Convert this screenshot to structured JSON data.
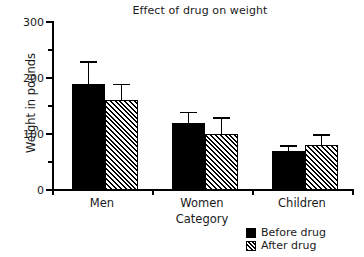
{
  "chart_data": {
    "type": "bar",
    "title": "Effect of drug on weight",
    "xlabel": "Category",
    "ylabel": "Weight in pounds",
    "categories": [
      "Men",
      "Women",
      "Children"
    ],
    "series": [
      {
        "name": "Before drug",
        "fill": "solid-black",
        "values": [
          190,
          120,
          70
        ],
        "errors": [
          40,
          20,
          10
        ]
      },
      {
        "name": "After drug",
        "fill": "diagonal-hatch",
        "values": [
          160,
          100,
          80
        ],
        "errors": [
          30,
          30,
          20
        ]
      }
    ],
    "ylim": [
      0,
      300
    ],
    "yticks": [
      0,
      100,
      200,
      300
    ],
    "ytick_labels": [
      "0",
      "100",
      "200",
      "300"
    ],
    "yticks_minor": [
      50,
      150,
      250
    ],
    "grid": false,
    "legend_position": "bottom-right",
    "colors": {
      "bar_before": "#000000",
      "bar_after_outline": "#000000",
      "bar_after_fill": "#ffffff",
      "axis": "#000000",
      "text": "#1a1a1a",
      "background": "#ffffff"
    }
  },
  "legend": {
    "items": [
      {
        "label": "Before drug"
      },
      {
        "label": "After drug"
      }
    ]
  }
}
